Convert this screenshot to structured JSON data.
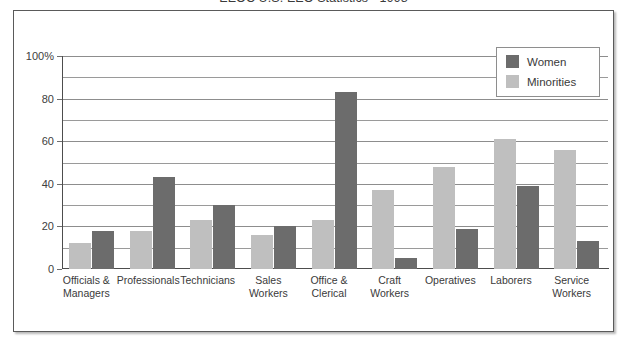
{
  "figure": {
    "title": "EEOC U.S. EEO Statistics - 1998",
    "frame_border_color": "#5a5a5a"
  },
  "legend": {
    "position": "top-right",
    "entries": [
      {
        "label": "Women",
        "color": "#6c6c6c"
      },
      {
        "label": "Minorities",
        "color": "#bfbfbf"
      }
    ]
  },
  "axes": {
    "y_ticks": [
      "100%",
      "80",
      "60",
      "40",
      "20",
      "0"
    ],
    "y_tick_values": [
      100,
      80,
      60,
      40,
      20,
      0
    ]
  },
  "chart_data": {
    "type": "bar",
    "title": "EEOC U.S. EEO Statistics - 1998",
    "xlabel": "",
    "ylabel": "",
    "ylim": [
      0,
      100
    ],
    "grid": true,
    "legend_position": "top-right",
    "categories": [
      "Officials & Managers",
      "Professionals",
      "Technicians",
      "Sales Workers",
      "Office & Clerical",
      "Craft Workers",
      "Operatives",
      "Laborers",
      "Service Workers"
    ],
    "category_lines": [
      [
        "Officials &",
        "Managers"
      ],
      [
        "Professionals"
      ],
      [
        "Technicians"
      ],
      [
        "Sales",
        "Workers"
      ],
      [
        "Office &",
        "Clerical"
      ],
      [
        "Craft",
        "Workers"
      ],
      [
        "Operatives"
      ],
      [
        "Laborers"
      ],
      [
        "Service",
        "Workers"
      ]
    ],
    "series": [
      {
        "name": "Minorities",
        "color": "#bfbfbf",
        "values": [
          12,
          18,
          23,
          16,
          23,
          37,
          48,
          61,
          56
        ]
      },
      {
        "name": "Women",
        "color": "#6c6c6c",
        "values": [
          18,
          43,
          30,
          20,
          83,
          5,
          19,
          39,
          13
        ]
      }
    ]
  }
}
